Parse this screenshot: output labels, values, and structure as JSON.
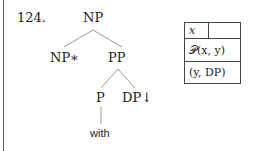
{
  "example_number": "124.",
  "tree": {
    "root": "NP",
    "left_child": "NP∗",
    "right_child": "PP",
    "pp_left": "P",
    "pp_right": "DP↓",
    "lexical_anchor": "with"
  },
  "semantic_box": {
    "row1_var": "x",
    "row1_empty": "",
    "row2": "𝒫(x, y)",
    "row3": "(y, DP)"
  },
  "colors": {
    "line": "#999999",
    "text": "#222222",
    "border": "#444444"
  }
}
